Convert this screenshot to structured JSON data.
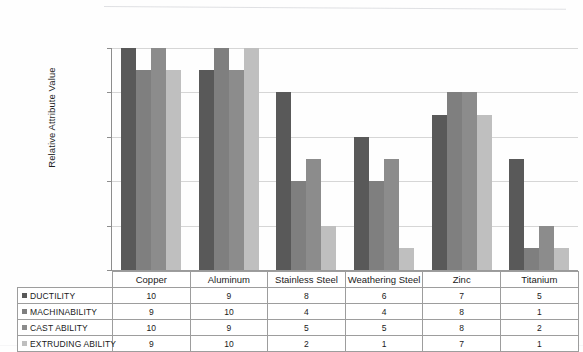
{
  "chart_data": {
    "type": "bar",
    "title": "",
    "xlabel": "",
    "ylabel": "Relative Attribute Value",
    "ylim": [
      0,
      10
    ],
    "yticks": [
      0,
      2,
      4,
      6,
      8,
      10
    ],
    "grid": true,
    "legend_position": "table-row-labels",
    "categories": [
      "Copper",
      "Aluminum",
      "Stainless Steel",
      "Weathering Steel",
      "Zinc",
      "Titanium"
    ],
    "series": [
      {
        "name": "DUCTILITY",
        "color": "#595959",
        "values": [
          10,
          9,
          8,
          6,
          7,
          5
        ]
      },
      {
        "name": "MACHINABILITY",
        "color": "#7f7f7f",
        "values": [
          9,
          10,
          4,
          4,
          8,
          1
        ]
      },
      {
        "name": "CAST ABILITY",
        "color": "#8c8c8c",
        "values": [
          10,
          9,
          5,
          5,
          8,
          2
        ]
      },
      {
        "name": "EXTRUDING ABILITY",
        "color": "#bfbfbf",
        "values": [
          9,
          10,
          2,
          1,
          7,
          1
        ]
      }
    ]
  },
  "table": {
    "corner_label": "",
    "column_headers": [
      "Copper",
      "Aluminum",
      "Stainless Steel",
      "Weathering Steel",
      "Zinc",
      "Titanium"
    ],
    "rows": [
      {
        "label": "DUCTILITY",
        "swatch": "#595959",
        "values": [
          "10",
          "9",
          "8",
          "6",
          "7",
          "5"
        ]
      },
      {
        "label": "MACHINABILITY",
        "swatch": "#7f7f7f",
        "values": [
          "9",
          "10",
          "4",
          "4",
          "8",
          "1"
        ]
      },
      {
        "label": "CAST ABILITY",
        "swatch": "#8c8c8c",
        "values": [
          "10",
          "9",
          "5",
          "5",
          "8",
          "2"
        ]
      },
      {
        "label": "EXTRUDING ABILITY",
        "swatch": "#bfbfbf",
        "values": [
          "9",
          "10",
          "2",
          "1",
          "7",
          "1"
        ]
      }
    ]
  },
  "axis": {
    "y_title": "Relative Attribute Value",
    "y_tick_labels": [
      "10",
      "8",
      "6",
      "4",
      "2",
      "0"
    ]
  }
}
